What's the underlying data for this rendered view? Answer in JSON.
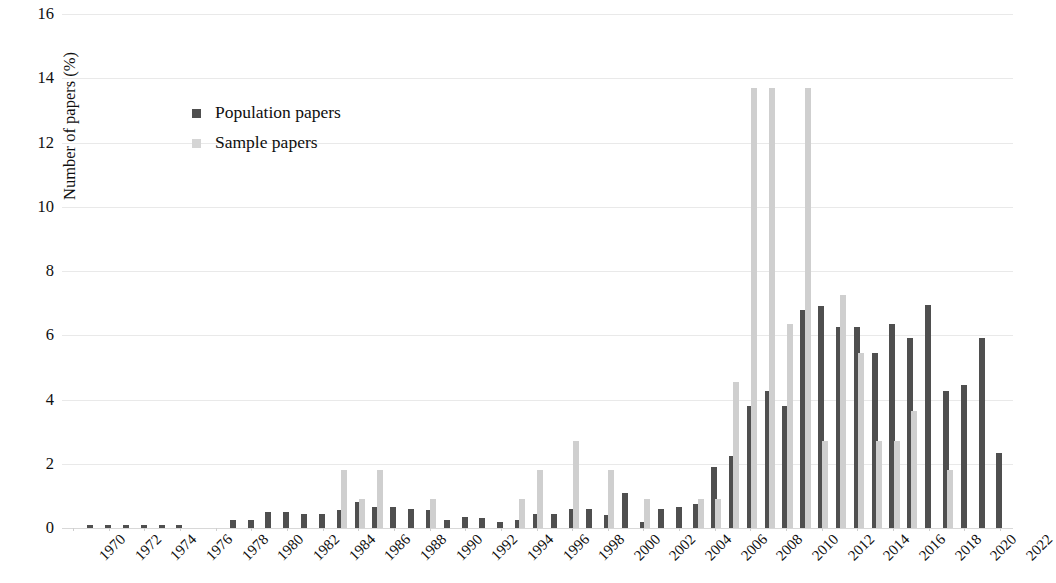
{
  "chart_data": {
    "type": "bar",
    "title": "",
    "subtitle": "",
    "xlabel": "",
    "ylabel": "Number of papers (%)",
    "ylim": [
      0,
      16
    ],
    "ytick_values": [
      0,
      2,
      4,
      6,
      8,
      10,
      12,
      14,
      16
    ],
    "ytick_labels": [
      "0",
      "2",
      "4",
      "6",
      "8",
      "10",
      "12",
      "14",
      "16"
    ],
    "grid": true,
    "grid_axis": "y",
    "legend_position": "upper-left-inside",
    "xtick_rotation": -45,
    "xtick_step": 2,
    "x": [
      1970,
      1971,
      1972,
      1973,
      1974,
      1975,
      1976,
      1977,
      1978,
      1979,
      1980,
      1981,
      1982,
      1983,
      1984,
      1985,
      1986,
      1987,
      1988,
      1989,
      1990,
      1991,
      1992,
      1993,
      1994,
      1995,
      1996,
      1997,
      1998,
      1999,
      2000,
      2001,
      2002,
      2003,
      2004,
      2005,
      2006,
      2007,
      2008,
      2009,
      2010,
      2011,
      2012,
      2013,
      2014,
      2015,
      2016,
      2017,
      2018,
      2019,
      2020,
      2021,
      2022
    ],
    "xtick_labels": [
      "1970",
      "1972",
      "1974",
      "1976",
      "1978",
      "1980",
      "1982",
      "1984",
      "1986",
      "1988",
      "1990",
      "1992",
      "1994",
      "1996",
      "1998",
      "2000",
      "2002",
      "2004",
      "2006",
      "2008",
      "2010",
      "2012",
      "2014",
      "2016",
      "2018",
      "2020",
      "2022"
    ],
    "series": [
      {
        "name": "Population papers",
        "color": "#4f4f4f",
        "values": [
          0,
          0.1,
          0.1,
          0.1,
          0.1,
          0.1,
          0.1,
          0,
          0,
          0.25,
          0.25,
          0.5,
          0.5,
          0.45,
          0.45,
          0.55,
          0.8,
          0.65,
          0.65,
          0.6,
          0.55,
          0.25,
          0.35,
          0.3,
          0.2,
          0.25,
          0.45,
          0.45,
          0.6,
          0.6,
          0.4,
          1.1,
          0.2,
          0.6,
          0.65,
          0.75,
          1.9,
          2.25,
          3.8,
          4.25,
          3.8,
          6.8,
          6.9,
          6.25,
          6.25,
          5.45,
          6.35,
          5.9,
          6.95,
          4.25,
          4.45,
          5.9,
          2.35
        ]
      },
      {
        "name": "Sample papers",
        "color": "#cfcfcf",
        "values": [
          0,
          0,
          0,
          0,
          0,
          0,
          0,
          0,
          0,
          0,
          0,
          0,
          0,
          0,
          0,
          1.8,
          0.9,
          1.8,
          0,
          0,
          0.9,
          0,
          0,
          0,
          0,
          0.9,
          1.8,
          0,
          2.7,
          0,
          1.8,
          0,
          0.9,
          0,
          0,
          0.9,
          0.9,
          4.55,
          13.7,
          13.7,
          6.35,
          13.7,
          2.7,
          7.25,
          5.45,
          2.7,
          2.7,
          3.65,
          0,
          1.8,
          0,
          0,
          0
        ]
      }
    ]
  },
  "legend": {
    "items": [
      {
        "label": "Population papers",
        "marker": "square-dark"
      },
      {
        "label": "Sample papers",
        "marker": "square-light"
      }
    ]
  },
  "axes": {
    "y_title": "Number of papers (%)"
  },
  "colors": {
    "population": "#4f4f4f",
    "sample": "#cfcfcf",
    "grid": "#e9e9e9",
    "text": "#0f0f0f",
    "background": "#ffffff"
  }
}
